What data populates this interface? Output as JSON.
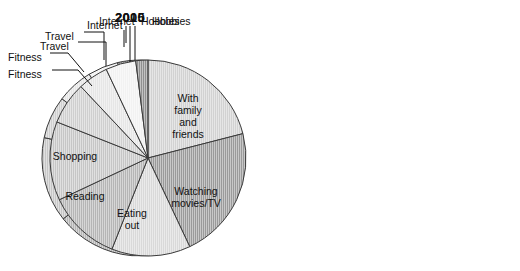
{
  "charts": [
    {
      "id": "chart-2005",
      "title": "2005",
      "center": {
        "x": 140,
        "y": 158
      },
      "radius": 98,
      "start_angle": -6,
      "labels_inside": [
        {
          "name": "With family and friends",
          "lines": [
            "With",
            "family",
            "and",
            "friends"
          ],
          "lx": 182,
          "ly": 118
        },
        {
          "name": "Watching movies/TV",
          "lines": [
            "Watching",
            "movies/TV"
          ],
          "lx": 158,
          "ly": 218
        },
        {
          "name": "Eating out",
          "lines": [
            "Eating",
            "out"
          ],
          "lx": 100,
          "ly": 218
        },
        {
          "name": "Reading",
          "lines": [
            "Reading"
          ],
          "lx": 77,
          "ly": 186
        },
        {
          "name": "Shopping",
          "lines": [
            "Shopping"
          ],
          "lx": 82,
          "ly": 138
        }
      ],
      "labels_outside": [
        {
          "name": "Fitness",
          "text": "Fitness",
          "tx": 8,
          "ty": 57,
          "anchor": "start",
          "leader": [
            [
              50,
              53
            ],
            [
              68,
              53
            ],
            [
              84,
              72
            ]
          ]
        },
        {
          "name": "Travel",
          "text": "Travel",
          "tx": 45,
          "ty": 36,
          "anchor": "start",
          "leader": [
            [
              84,
              32
            ],
            [
              104,
              32
            ],
            [
              104,
              60
            ]
          ]
        },
        {
          "name": "Internet",
          "text": "Internet",
          "tx": 99,
          "ty": 21,
          "anchor": "start",
          "leader": [
            [
              126,
              26
            ],
            [
              126,
              43
            ]
          ]
        },
        {
          "name": "Hobbies",
          "text": "Hobbies",
          "tx": 152,
          "ty": 21,
          "anchor": "start",
          "leader": [
            [
              135,
              26
            ],
            [
              135,
              62
            ]
          ]
        }
      ]
    },
    {
      "id": "chart-2010",
      "title": "2010",
      "center": {
        "x": 148,
        "y": 158
      },
      "radius": 98,
      "start_angle": 0,
      "labels_inside": [
        {
          "name": "With family and friends",
          "lines": [
            "With",
            "family",
            "and",
            "friends"
          ],
          "lx": 188,
          "ly": 102
        },
        {
          "name": "Watching movies/TV",
          "lines": [
            "Watching",
            "movies/TV"
          ],
          "lx": 196,
          "ly": 195
        },
        {
          "name": "Eating out",
          "lines": [
            "Eating",
            "out"
          ],
          "lx": 132,
          "ly": 217
        },
        {
          "name": "Reading",
          "lines": [
            "Reading"
          ],
          "lx": 85,
          "ly": 200
        },
        {
          "name": "Shopping",
          "lines": [
            "Shopping"
          ],
          "lx": 75,
          "ly": 160
        }
      ],
      "labels_outside": [
        {
          "name": "Fitness",
          "text": "Fitness",
          "tx": 8,
          "ty": 74,
          "anchor": "start",
          "leader": [
            [
              52,
              70
            ],
            [
              78,
              70
            ],
            [
              92,
              86
            ]
          ]
        },
        {
          "name": "Travel",
          "text": "Travel",
          "tx": 40,
          "ty": 46,
          "anchor": "start",
          "leader": [
            [
              78,
              42
            ],
            [
              106,
              42
            ],
            [
              106,
              66
            ]
          ]
        },
        {
          "name": "Internet",
          "text": "Internet",
          "tx": 87,
          "ty": 25,
          "anchor": "start",
          "leader": [
            [
              124,
              30
            ],
            [
              124,
              47
            ]
          ]
        },
        {
          "name": "Hobbies",
          "text": "Hobbies",
          "tx": 141,
          "ty": 21,
          "anchor": "start",
          "leader": [
            [
              130,
              26
            ],
            [
              130,
              62
            ]
          ]
        }
      ]
    }
  ],
  "chart_data": {
    "type": "pie",
    "subtitle": "",
    "xlabel": "",
    "ylabel": "",
    "legend_position": "labels-on-slices",
    "categories": [
      "With family and friends",
      "Watching movies/TV",
      "Eating out",
      "Reading",
      "Shopping",
      "Fitness",
      "Travel",
      "Internet",
      "Hobbies"
    ],
    "unit": "percent",
    "series": [
      {
        "name": "2005",
        "values": [
          25,
          17,
          11,
          13,
          14,
          7,
          6,
          5,
          2
        ]
      },
      {
        "name": "2010",
        "values": [
          21,
          22,
          13,
          12,
          13,
          7,
          5,
          5,
          2
        ]
      }
    ],
    "colors": {
      "With family and friends": "#d2d2d2",
      "Watching movies/TV": "#9a9a9a",
      "Eating out": "#d9d9d9",
      "Reading": "#b5b5b5",
      "Shopping": "#c6c6c6",
      "Fitness": "#cfcfcf",
      "Travel": "#e6e6e6",
      "Internet": "#f2f2f2",
      "Hobbies": "#8f8f8f",
      "outline": "#3a3a3a",
      "background": "#ffffff",
      "text": "#111111"
    }
  }
}
